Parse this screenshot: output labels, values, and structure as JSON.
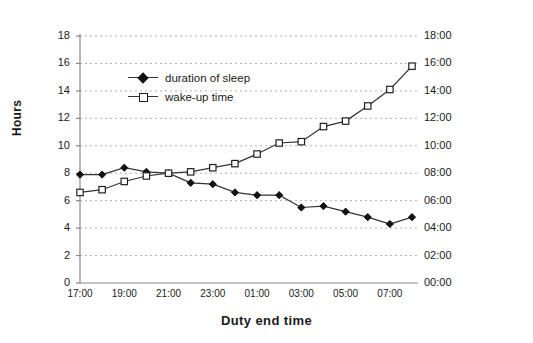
{
  "chart_data": {
    "type": "line",
    "title": "",
    "xlabel": "Duty end time",
    "ylabel": "Hours",
    "y2label": "",
    "grid": true,
    "legend_position": "inside-top-left",
    "ylim": [
      0,
      18
    ],
    "y_ticks": [
      "0",
      "2",
      "4",
      "6",
      "8",
      "10",
      "12",
      "14",
      "16",
      "18"
    ],
    "y2_ticks": [
      "00:00",
      "02:00",
      "04:00",
      "06:00",
      "08:00",
      "10:00",
      "12:00",
      "14:00",
      "16:00",
      "18:00"
    ],
    "x_ticks": [
      "17:00",
      "19:00",
      "21:00",
      "23:00",
      "01:00",
      "03:00",
      "05:00",
      "07:00"
    ],
    "x": [
      "17:00",
      "18:00",
      "19:00",
      "20:00",
      "21:00",
      "22:00",
      "23:00",
      "00:00",
      "01:00",
      "02:00",
      "03:00",
      "04:00",
      "05:00",
      "06:00",
      "07:00",
      "08:00"
    ],
    "series": [
      {
        "name": "duration of sleep",
        "marker": "filled-diamond",
        "axis": "left",
        "values": [
          7.9,
          7.9,
          8.4,
          8.1,
          8.0,
          7.3,
          7.2,
          6.6,
          6.4,
          6.4,
          5.5,
          5.6,
          5.2,
          4.8,
          4.3,
          4.8
        ]
      },
      {
        "name": "wake-up time",
        "marker": "open-square",
        "axis": "right",
        "values": [
          6.6,
          6.8,
          7.4,
          7.8,
          8.0,
          8.1,
          8.4,
          8.7,
          9.4,
          10.2,
          10.3,
          11.4,
          11.8,
          12.9,
          14.1,
          15.8
        ],
        "value_labels": [
          "06:36",
          "06:48",
          "07:24",
          "07:48",
          "08:00",
          "08:06",
          "08:24",
          "08:42",
          "09:24",
          "10:12",
          "10:18",
          "11:24",
          "11:48",
          "12:54",
          "14:06",
          "15:48"
        ]
      }
    ]
  },
  "legend": {
    "items": [
      {
        "label": "duration of sleep"
      },
      {
        "label": "wake-up time"
      }
    ]
  },
  "colors": {
    "series_line": "#333333",
    "grid": "#b0b0b0",
    "axis": "#888888",
    "text": "#1a1a1a"
  }
}
